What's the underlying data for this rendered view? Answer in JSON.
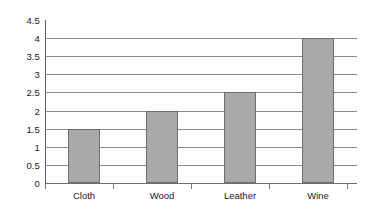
{
  "chart_data": {
    "type": "bar",
    "title": "",
    "subtitle": "",
    "xlabel": "",
    "ylabel": "",
    "categories": [
      "Cloth",
      "Wood",
      "Leather",
      "Wine"
    ],
    "values": [
      1.5,
      2,
      2.5,
      4
    ],
    "ylim": [
      0,
      4.5
    ],
    "yticks": [
      "0",
      "0.5",
      "1",
      "1.5",
      "2",
      "2.5",
      "3",
      "3.5",
      "4",
      "4.5"
    ],
    "ytick_values": [
      0,
      0.5,
      1,
      1.5,
      2,
      2.5,
      3,
      3.5,
      4,
      4.5
    ],
    "grid": true,
    "legend": false,
    "legend_position": "none",
    "bar_color": "#a9a9a9",
    "bar_border_color": "#6e6e6e",
    "grid_color": "#8a8a8a",
    "axis_color": "#5e5e5e",
    "text_color": "#1a1a1a",
    "background": "#ffffff"
  }
}
